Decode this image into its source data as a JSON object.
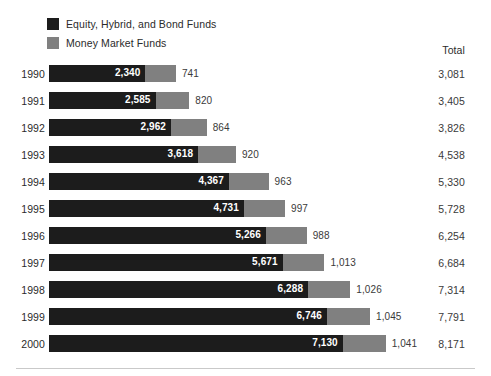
{
  "legend": {
    "items": [
      {
        "label": "Equity, Hybrid, and Bond Funds",
        "color": "#1c1c1c",
        "key": "equity_hybrid_bond"
      },
      {
        "label": "Money Market Funds",
        "color": "#808080",
        "key": "money_market"
      }
    ]
  },
  "columns": {
    "total_header": "Total"
  },
  "chart_data": {
    "type": "bar",
    "orientation": "horizontal",
    "stacked": true,
    "title": "",
    "subtitle": "",
    "xlabel": "",
    "ylabel": "",
    "grid": false,
    "legend_position": "top-left",
    "xlim": [
      0,
      8171
    ],
    "px_per_unit": 0.0412,
    "categories": [
      "1990",
      "1991",
      "1992",
      "1993",
      "1994",
      "1995",
      "1996",
      "1997",
      "1998",
      "1999",
      "2000"
    ],
    "series": [
      {
        "name": "Equity, Hybrid, and Bond Funds",
        "color": "#1c1c1c",
        "values": [
          2340,
          2585,
          2962,
          3618,
          4367,
          4731,
          5266,
          5671,
          6288,
          6746,
          7130
        ],
        "labels": [
          "2,340",
          "2,585",
          "2,962",
          "3,618",
          "4,367",
          "4,731",
          "5,266",
          "5,671",
          "6,288",
          "6,746",
          "7,130"
        ]
      },
      {
        "name": "Money Market Funds",
        "color": "#808080",
        "values": [
          741,
          820,
          864,
          920,
          963,
          997,
          988,
          1013,
          1026,
          1045,
          1041
        ],
        "labels": [
          "741",
          "820",
          "864",
          "920",
          "963",
          "997",
          "988",
          "1,013",
          "1,026",
          "1,045",
          "1,041"
        ]
      }
    ],
    "totals": [
      3081,
      3405,
      3826,
      4538,
      5330,
      5728,
      6254,
      6684,
      7314,
      7791,
      8171
    ],
    "total_labels": [
      "3,081",
      "3,405",
      "3,826",
      "4,538",
      "5,330",
      "5,728",
      "6,254",
      "6,684",
      "7,314",
      "7,791",
      "8,171"
    ]
  }
}
